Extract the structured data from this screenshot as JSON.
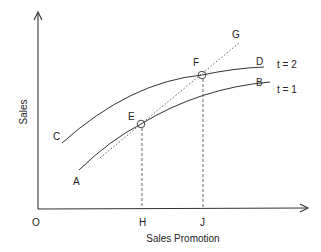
{
  "diagram": {
    "axes": {
      "x_label": "Sales Promotion",
      "y_label": "Sales",
      "origin_label": "O",
      "x_ticks": [
        "H",
        "J"
      ]
    },
    "curves": [
      {
        "id": "t1",
        "start_label": "A",
        "end_label": "B",
        "period_label": "t = 1"
      },
      {
        "id": "t2",
        "start_label": "C",
        "end_label": "D",
        "period_label": "t = 2"
      }
    ],
    "points": [
      {
        "label": "E",
        "on_curve": "t1",
        "x_tick": "H"
      },
      {
        "label": "F",
        "on_curve": "t2",
        "x_tick": "J"
      }
    ],
    "trend_line": {
      "end_label": "G",
      "style": "dotted"
    },
    "colors": {
      "line": "#333333",
      "background": "#ffffff"
    }
  }
}
